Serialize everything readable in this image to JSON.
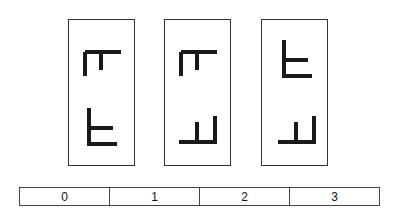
{
  "colors": {
    "stroke": "#1a1a1a",
    "border": "#333333"
  },
  "cards": [
    {
      "id": 1,
      "top_glyph": "rotated-F-down",
      "bottom_glyph": "rotated-F-up"
    },
    {
      "id": 2,
      "top_glyph": "rotated-F-down",
      "bottom_glyph": "rotated-F-mirror-up"
    },
    {
      "id": 3,
      "top_glyph": "rotated-F-up",
      "bottom_glyph": "rotated-F-mirror-up"
    }
  ],
  "scale": {
    "labels": [
      "0",
      "1",
      "2",
      "3"
    ]
  }
}
